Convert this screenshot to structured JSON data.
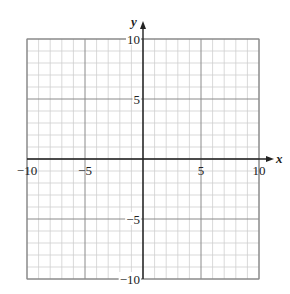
{
  "chart_data": {
    "type": "scatter",
    "title": "",
    "xlabel": "x",
    "ylabel": "y",
    "xlim": [
      -10,
      10
    ],
    "ylim": [
      -10,
      10
    ],
    "grid": true,
    "minor_grid_step": 1,
    "major_grid_step": 5,
    "x_ticks": [
      {
        "value": -10,
        "label": "−10"
      },
      {
        "value": -5,
        "label": "−5"
      },
      {
        "value": 5,
        "label": "5"
      },
      {
        "value": 10,
        "label": "10"
      }
    ],
    "y_ticks": [
      {
        "value": 10,
        "label": "10"
      },
      {
        "value": 5,
        "label": "5"
      },
      {
        "value": -5,
        "label": "−5"
      },
      {
        "value": -10,
        "label": "−10"
      }
    ],
    "series": [],
    "legend": null
  },
  "colors": {
    "minor_grid": "#cfcfcf",
    "major_grid": "#8a8a8a",
    "axis": "#222222",
    "background": "#ffffff"
  },
  "layout": {
    "grid_left": 27,
    "grid_top": 39,
    "grid_right": 259,
    "grid_bottom": 279
  }
}
